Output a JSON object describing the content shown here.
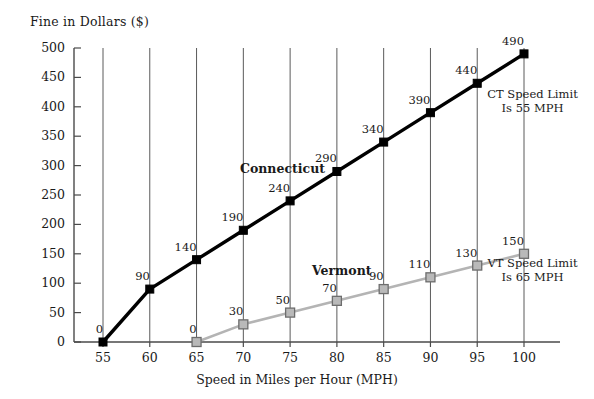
{
  "chart_data": {
    "type": "line",
    "title": "",
    "xlabel": "Speed in Miles per Hour (MPH)",
    "ylabel": "Fine in Dollars ($)",
    "x": [
      55,
      60,
      65,
      70,
      75,
      80,
      85,
      90,
      95,
      100
    ],
    "xticks": [
      "55",
      "60",
      "65",
      "70",
      "75",
      "80",
      "85",
      "90",
      "95",
      "100"
    ],
    "yticks": [
      "0",
      "50",
      "100",
      "150",
      "200",
      "250",
      "300",
      "350",
      "400",
      "450",
      "500"
    ],
    "xlim": [
      55,
      100
    ],
    "ylim": [
      0,
      500
    ],
    "grid": "vertical",
    "legend": "inline-labels",
    "series": [
      {
        "name": "Connecticut",
        "color": "#000000",
        "marker": "filled-square",
        "x": [
          55,
          60,
          65,
          70,
          75,
          80,
          85,
          90,
          95,
          100
        ],
        "values": [
          0,
          90,
          140,
          190,
          240,
          290,
          340,
          390,
          440,
          490
        ],
        "labels": [
          "0",
          "90",
          "140",
          "190",
          "240",
          "290",
          "340",
          "390",
          "440",
          "490"
        ],
        "annotation": [
          "CT Speed Limit",
          "Is 55 MPH"
        ]
      },
      {
        "name": "Vermont",
        "color": "#b0b0b0",
        "marker": "gray-square",
        "x": [
          65,
          70,
          75,
          80,
          85,
          90,
          95,
          100
        ],
        "values": [
          0,
          30,
          50,
          70,
          90,
          110,
          130,
          150
        ],
        "labels": [
          "0",
          "30",
          "50",
          "70",
          "90",
          "110",
          "130",
          "150"
        ],
        "annotation": [
          "VT Speed Limit",
          "Is 65 MPH"
        ]
      }
    ]
  },
  "colors": {
    "connecticut_line": "#000000",
    "vermont_line": "#b4b4b4",
    "vermont_marker_fill": "#b9b9b9",
    "vermont_marker_stroke": "#6d6d6d",
    "axis": "#4a4a4a",
    "grid": "#5a5a5a",
    "background": "#ffffff",
    "text": "#1a1a1a"
  }
}
